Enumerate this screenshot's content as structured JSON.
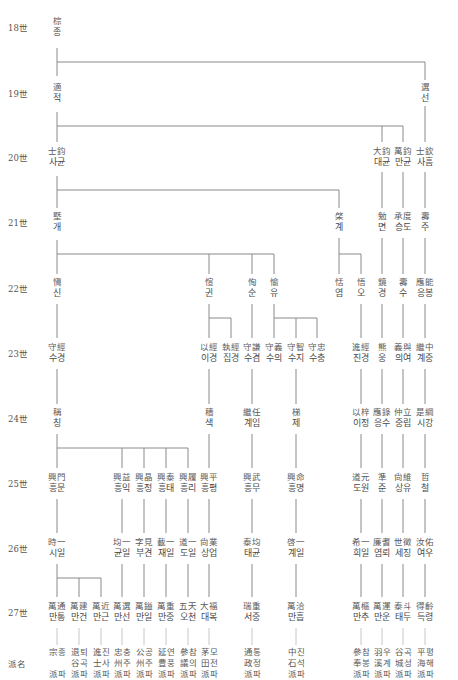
{
  "generations": [
    {
      "label": "18世",
      "y": 27
    },
    {
      "label": "19世",
      "y": 93
    },
    {
      "label": "20世",
      "y": 157
    },
    {
      "label": "21世",
      "y": 222
    },
    {
      "label": "22世",
      "y": 288
    },
    {
      "label": "23世",
      "y": 353
    },
    {
      "label": "24世",
      "y": 418
    },
    {
      "label": "25世",
      "y": 483
    },
    {
      "label": "26世",
      "y": 548
    },
    {
      "label": "27世",
      "y": 612
    },
    {
      "label": "派名",
      "y": 663
    }
  ],
  "nodes": [
    {
      "id": "g18a",
      "hanja": "棕",
      "hangul": "종",
      "x": 57,
      "y": 27
    },
    {
      "id": "g19a",
      "hanja": "適",
      "hangul": "적",
      "x": 57,
      "y": 93
    },
    {
      "id": "g19b",
      "hanja": "選",
      "hangul": "선",
      "x": 425,
      "y": 93
    },
    {
      "id": "g20a",
      "hanja": "士鈞",
      "hangul": "사균",
      "x": 57,
      "y": 157
    },
    {
      "id": "g20b",
      "hanja": "大鈞",
      "hangul": "대균",
      "x": 382,
      "y": 157
    },
    {
      "id": "g20c",
      "hanja": "萬鈞",
      "hangul": "만균",
      "x": 403,
      "y": 157
    },
    {
      "id": "g20d",
      "hanja": "士欽",
      "hangul": "사흠",
      "x": 425,
      "y": 157
    },
    {
      "id": "g21a",
      "hanja": "墍",
      "hangul": "개",
      "x": 57,
      "y": 222
    },
    {
      "id": "g21b",
      "hanja": "棨",
      "hangul": "계",
      "x": 339,
      "y": 222
    },
    {
      "id": "g21c",
      "hanja": "勉",
      "hangul": "면",
      "x": 382,
      "y": 222
    },
    {
      "id": "g21d",
      "hanja": "承度",
      "hangul": "승도",
      "x": 403,
      "y": 222
    },
    {
      "id": "g21e",
      "hanja": "壽",
      "hangul": "주",
      "x": 425,
      "y": 222
    },
    {
      "id": "g22a",
      "hanja": "愼",
      "hangul": "신",
      "x": 57,
      "y": 288
    },
    {
      "id": "g22b",
      "hanja": "愃",
      "hangul": "귄",
      "x": 209,
      "y": 288
    },
    {
      "id": "g22c",
      "hanja": "恂",
      "hangul": "순",
      "x": 252,
      "y": 288
    },
    {
      "id": "g22d",
      "hanja": "愉",
      "hangul": "유",
      "x": 274,
      "y": 288
    },
    {
      "id": "g22e",
      "hanja": "恬",
      "hangul": "염",
      "x": 339,
      "y": 288
    },
    {
      "id": "g22f",
      "hanja": "悟",
      "hangul": "오",
      "x": 361,
      "y": 288
    },
    {
      "id": "g22g",
      "hanja": "鏡",
      "hangul": "경",
      "x": 382,
      "y": 288
    },
    {
      "id": "g22h",
      "hanja": "壽",
      "hangul": "수",
      "x": 403,
      "y": 288
    },
    {
      "id": "g22i",
      "hanja": "應能",
      "hangul": "응봉",
      "x": 425,
      "y": 288
    },
    {
      "id": "g23a",
      "hanja": "守經",
      "hangul": "수경",
      "x": 57,
      "y": 353
    },
    {
      "id": "g23b",
      "hanja": "以經",
      "hangul": "이경",
      "x": 209,
      "y": 353
    },
    {
      "id": "g23c",
      "hanja": "執經",
      "hangul": "집경",
      "x": 231,
      "y": 353
    },
    {
      "id": "g23d",
      "hanja": "守謙",
      "hangul": "수겸",
      "x": 252,
      "y": 353
    },
    {
      "id": "g23e",
      "hanja": "守義",
      "hangul": "수의",
      "x": 274,
      "y": 353
    },
    {
      "id": "g23f",
      "hanja": "守智",
      "hangul": "수지",
      "x": 296,
      "y": 353
    },
    {
      "id": "g23g",
      "hanja": "守忠",
      "hangul": "수충",
      "x": 317,
      "y": 353
    },
    {
      "id": "g23h",
      "hanja": "進經",
      "hangul": "진경",
      "x": 361,
      "y": 353
    },
    {
      "id": "g23i",
      "hanja": "熊",
      "hangul": "웅",
      "x": 382,
      "y": 353
    },
    {
      "id": "g23j",
      "hanja": "義與",
      "hangul": "의여",
      "x": 403,
      "y": 353
    },
    {
      "id": "g23k",
      "hanja": "繼中",
      "hangul": "계중",
      "x": 425,
      "y": 353
    },
    {
      "id": "g24a",
      "hanja": "稱",
      "hangul": "칭",
      "x": 57,
      "y": 418
    },
    {
      "id": "g24b",
      "hanja": "穡",
      "hangul": "색",
      "x": 209,
      "y": 418
    },
    {
      "id": "g24c",
      "hanja": "繼任",
      "hangul": "계임",
      "x": 252,
      "y": 418
    },
    {
      "id": "g24d",
      "hanja": "梯",
      "hangul": "제",
      "x": 296,
      "y": 418
    },
    {
      "id": "g24e",
      "hanja": "以梓",
      "hangul": "이정",
      "x": 361,
      "y": 418
    },
    {
      "id": "g24f",
      "hanja": "應錄",
      "hangul": "응수",
      "x": 382,
      "y": 418
    },
    {
      "id": "g24g",
      "hanja": "仲立",
      "hangul": "중립",
      "x": 403,
      "y": 418
    },
    {
      "id": "g24h",
      "hanja": "是綱",
      "hangul": "시강",
      "x": 425,
      "y": 418
    },
    {
      "id": "g25a",
      "hanja": "興門",
      "hangul": "흥문",
      "x": 57,
      "y": 483
    },
    {
      "id": "g25b",
      "hanja": "興益",
      "hangul": "흥익",
      "x": 122,
      "y": 483
    },
    {
      "id": "g25c",
      "hanja": "興晶",
      "hangul": "흥정",
      "x": 144,
      "y": 483
    },
    {
      "id": "g25d",
      "hanja": "興泰",
      "hangul": "흥태",
      "x": 166,
      "y": 483
    },
    {
      "id": "g25e",
      "hanja": "興履",
      "hangul": "흥리",
      "x": 188,
      "y": 483
    },
    {
      "id": "g25f",
      "hanja": "興平",
      "hangul": "흥평",
      "x": 209,
      "y": 483
    },
    {
      "id": "g25g",
      "hanja": "興武",
      "hangul": "흥무",
      "x": 252,
      "y": 483
    },
    {
      "id": "g25h",
      "hanja": "興命",
      "hangul": "흥명",
      "x": 296,
      "y": 483
    },
    {
      "id": "g25i",
      "hanja": "道元",
      "hangul": "도원",
      "x": 361,
      "y": 483
    },
    {
      "id": "g25j",
      "hanja": "準",
      "hangul": "준",
      "x": 382,
      "y": 483
    },
    {
      "id": "g25k",
      "hanja": "尙維",
      "hangul": "상유",
      "x": 403,
      "y": 483
    },
    {
      "id": "g25l",
      "hanja": "哲",
      "hangul": "철",
      "x": 425,
      "y": 483
    },
    {
      "id": "g26a",
      "hanja": "時一",
      "hangul": "시일",
      "x": 57,
      "y": 548
    },
    {
      "id": "g26b",
      "hanja": "均一",
      "hangul": "균일",
      "x": 122,
      "y": 548
    },
    {
      "id": "g26c",
      "hanja": "字見",
      "hangul": "부견",
      "x": 144,
      "y": 548
    },
    {
      "id": "g26d",
      "hanja": "載一",
      "hangul": "재일",
      "x": 166,
      "y": 548
    },
    {
      "id": "g26e",
      "hanja": "道一",
      "hangul": "도일",
      "x": 188,
      "y": 548
    },
    {
      "id": "g26f",
      "hanja": "尙業",
      "hangul": "상업",
      "x": 209,
      "y": 548
    },
    {
      "id": "g26g",
      "hanja": "泰均",
      "hangul": "태균",
      "x": 252,
      "y": 548
    },
    {
      "id": "g26h",
      "hanja": "啓一",
      "hangul": "계일",
      "x": 296,
      "y": 548
    },
    {
      "id": "g26i",
      "hanja": "希一",
      "hangul": "희일",
      "x": 361,
      "y": 548
    },
    {
      "id": "g26j",
      "hanja": "廉耆",
      "hangul": "염뢰",
      "x": 382,
      "y": 548
    },
    {
      "id": "g26k",
      "hanja": "世徵",
      "hangul": "세징",
      "x": 403,
      "y": 548
    },
    {
      "id": "g26l",
      "hanja": "汝佑",
      "hangul": "여우",
      "x": 425,
      "y": 548
    },
    {
      "id": "g27a",
      "hanja": "萬通",
      "hangul": "만통",
      "x": 57,
      "y": 612
    },
    {
      "id": "g27b",
      "hanja": "萬建",
      "hangul": "만건",
      "x": 79,
      "y": 612
    },
    {
      "id": "g27c",
      "hanja": "萬近",
      "hangul": "만근",
      "x": 101,
      "y": 612
    },
    {
      "id": "g27d",
      "hanja": "萬選",
      "hangul": "만선",
      "x": 122,
      "y": 612
    },
    {
      "id": "g27e",
      "hanja": "萬鎰",
      "hangul": "만일",
      "x": 144,
      "y": 612
    },
    {
      "id": "g27f",
      "hanja": "萬重",
      "hangul": "만중",
      "x": 166,
      "y": 612
    },
    {
      "id": "g27g",
      "hanja": "五天",
      "hangul": "오천",
      "x": 188,
      "y": 612
    },
    {
      "id": "g27h",
      "hanja": "大福",
      "hangul": "대복",
      "x": 209,
      "y": 612
    },
    {
      "id": "g27i",
      "hanja": "瑞重",
      "hangul": "서중",
      "x": 252,
      "y": 612
    },
    {
      "id": "g27j",
      "hanja": "萬洽",
      "hangul": "만흡",
      "x": 296,
      "y": 612
    },
    {
      "id": "g27k",
      "hanja": "萬樞",
      "hangul": "만추",
      "x": 361,
      "y": 612
    },
    {
      "id": "g27l",
      "hanja": "萬運",
      "hangul": "만운",
      "x": 382,
      "y": 612
    },
    {
      "id": "g27m",
      "hanja": "泰斗",
      "hangul": "태두",
      "x": 403,
      "y": 612
    },
    {
      "id": "g27n",
      "hanja": "得齡",
      "hangul": "득령",
      "x": 425,
      "y": 612
    }
  ],
  "pa_names": [
    {
      "lines": [
        "宗종",
        "",
        "派파"
      ],
      "x": 57
    },
    {
      "lines": [
        "退퇴",
        "谷곡",
        "派파"
      ],
      "x": 79
    },
    {
      "lines": [
        "進진",
        "士사",
        "派파"
      ],
      "x": 101
    },
    {
      "lines": [
        "忠충",
        "州주",
        "派파"
      ],
      "x": 122
    },
    {
      "lines": [
        "公공",
        "州주",
        "派파"
      ],
      "x": 144
    },
    {
      "lines": [
        "延연",
        "豊풍",
        "派파"
      ],
      "x": 166
    },
    {
      "lines": [
        "參참",
        "議의",
        "派파"
      ],
      "x": 188
    },
    {
      "lines": [
        "茅모",
        "田전",
        "派파"
      ],
      "x": 209
    },
    {
      "lines": [
        "通통",
        "政정",
        "派파"
      ],
      "x": 252
    },
    {
      "lines": [
        "中진",
        "石석",
        "派파"
      ],
      "x": 296
    },
    {
      "lines": [
        "參참",
        "奉봉",
        "派파"
      ],
      "x": 361
    },
    {
      "lines": [
        "羽우",
        "溪계",
        "派파"
      ],
      "x": 382
    },
    {
      "lines": [
        "谷곡",
        "城성",
        "派파"
      ],
      "x": 403
    },
    {
      "lines": [
        "平평",
        "海해",
        "派파"
      ],
      "x": 425
    }
  ],
  "pa_row_y": 663,
  "colors": {
    "line": "#8a8a8a",
    "text": "#4a4a4a",
    "faint_line": "#c8c8c8"
  }
}
